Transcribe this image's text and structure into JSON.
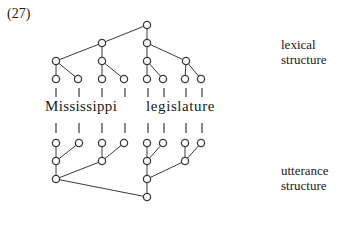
{
  "example_number": "(27)",
  "words": [
    "Mississippi",
    "legislature"
  ],
  "labels": {
    "lexical": [
      "lexical",
      "structure"
    ],
    "utterance": [
      "utterance",
      "structure"
    ]
  },
  "colors": {
    "line": "#3a3a3a",
    "node_fill": "#ffffff",
    "text": "#1a1a1a"
  },
  "diagram": {
    "lexical_structure": {
      "nodes": [
        {
          "id": "root",
          "x": 147,
          "y": 25
        },
        {
          "id": "L2a",
          "x": 102,
          "y": 43
        },
        {
          "id": "L2b",
          "x": 147,
          "y": 43
        },
        {
          "id": "L3a",
          "x": 56,
          "y": 61
        },
        {
          "id": "L3b",
          "x": 102,
          "y": 61
        },
        {
          "id": "L3c",
          "x": 147,
          "y": 61
        },
        {
          "id": "L3d",
          "x": 186,
          "y": 61
        },
        {
          "id": "l1",
          "x": 56,
          "y": 79
        },
        {
          "id": "l2",
          "x": 78,
          "y": 79
        },
        {
          "id": "l3",
          "x": 102,
          "y": 79
        },
        {
          "id": "l4",
          "x": 124,
          "y": 79
        },
        {
          "id": "l5",
          "x": 147,
          "y": 79
        },
        {
          "id": "l6",
          "x": 163,
          "y": 79
        },
        {
          "id": "l7",
          "x": 185,
          "y": 79
        },
        {
          "id": "l8",
          "x": 201,
          "y": 79
        }
      ]
    },
    "utterance_structure": {
      "nodes": [
        {
          "id": "u1",
          "x": 56,
          "y": 143
        },
        {
          "id": "u2",
          "x": 79,
          "y": 143
        },
        {
          "id": "u3",
          "x": 102,
          "y": 143
        },
        {
          "id": "u4",
          "x": 124,
          "y": 143
        },
        {
          "id": "u5",
          "x": 147,
          "y": 143
        },
        {
          "id": "u6",
          "x": 163,
          "y": 143
        },
        {
          "id": "u7",
          "x": 185,
          "y": 143
        },
        {
          "id": "u8",
          "x": 201,
          "y": 143
        },
        {
          "id": "U2a",
          "x": 56,
          "y": 161
        },
        {
          "id": "U2b",
          "x": 102,
          "y": 161
        },
        {
          "id": "U2c",
          "x": 147,
          "y": 161
        },
        {
          "id": "U2d",
          "x": 185,
          "y": 161
        },
        {
          "id": "U3a",
          "x": 56,
          "y": 179
        },
        {
          "id": "U3b",
          "x": 147,
          "y": 179
        },
        {
          "id": "uroot",
          "x": 147,
          "y": 197
        }
      ]
    }
  }
}
